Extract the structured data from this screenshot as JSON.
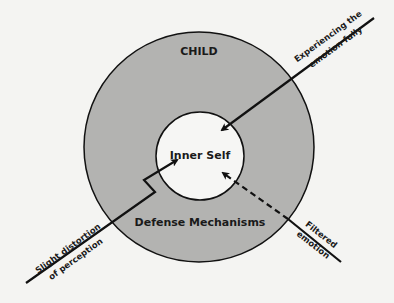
{
  "diagram": {
    "outer_label": "CHILD",
    "inner_label": "Inner Self",
    "ring_label": "Defense Mechanisms",
    "arrows": [
      {
        "id": "experiencing",
        "line1": "Experiencing the",
        "line2": "emotion fully",
        "style": "solid"
      },
      {
        "id": "distortion",
        "line1": "Slight distortion",
        "line2": "of perception",
        "style": "solid-zigzag"
      },
      {
        "id": "filtered",
        "line1": "Filtered",
        "line2": "emotion",
        "style": "dashed"
      }
    ],
    "colors": {
      "background": "#f4f4f2",
      "ring_fill": "#b3b3b1",
      "inner_fill": "#f6f6f4",
      "stroke": "#111111"
    }
  }
}
